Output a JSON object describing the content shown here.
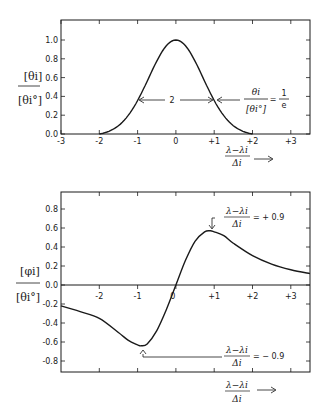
{
  "chart_data": [
    {
      "id": "top",
      "type": "line",
      "title": "",
      "ylabel": "[θi] / [θi°]",
      "xlabel": "(λ−λi)/Δi →",
      "xlim": [
        -3,
        3.5
      ],
      "ylim": [
        0,
        1.2
      ],
      "xticks": [
        "-3",
        "-2",
        "-1",
        "0",
        "+1",
        "+2",
        "+3"
      ],
      "yticks": [
        "0.0",
        "0.2",
        "0.4",
        "0.6",
        "0.8",
        "1.0"
      ],
      "series": [
        {
          "name": "theta_i normalized (Gaussian)",
          "x": [
            -2.0,
            -1.75,
            -1.5,
            -1.25,
            -1.0,
            -0.75,
            -0.5,
            -0.25,
            0.0,
            0.25,
            0.5,
            0.75,
            1.0,
            1.25,
            1.5,
            1.75,
            2.0
          ],
          "y": [
            0.0,
            0.05,
            0.11,
            0.22,
            0.37,
            0.57,
            0.78,
            0.94,
            1.0,
            0.94,
            0.78,
            0.57,
            0.37,
            0.22,
            0.11,
            0.05,
            0.0
          ]
        }
      ],
      "annotations": [
        {
          "text": "2",
          "note": "full width at 1/e between x=-1 and x=+1"
        },
        {
          "text": "θi / [θi°] = 1/e"
        }
      ]
    },
    {
      "id": "bottom",
      "type": "line",
      "title": "",
      "ylabel": "[φi] / [θi°]",
      "xlabel": "(λ−λi)/Δi →",
      "xlim": [
        -3,
        3.5
      ],
      "ylim": [
        -0.9,
        1.0
      ],
      "xticks": [
        "-2",
        "-1",
        "0",
        "+1",
        "+2",
        "+3"
      ],
      "yticks": [
        "0.8",
        "0.6",
        "0.4",
        "0.2",
        "0.0",
        "-0.2",
        "-0.4",
        "-0.6",
        "-0.8"
      ],
      "series": [
        {
          "name": "phi_i normalized (dispersion)",
          "x": [
            -3.0,
            -2.5,
            -2.0,
            -1.5,
            -1.25,
            -1.0,
            -0.9,
            -0.75,
            -0.5,
            -0.25,
            0.0,
            0.25,
            0.5,
            0.75,
            0.9,
            1.0,
            1.25,
            1.5,
            2.0,
            2.5,
            3.0,
            3.5
          ],
          "y": [
            -0.22,
            -0.28,
            -0.35,
            -0.5,
            -0.58,
            -0.63,
            -0.64,
            -0.62,
            -0.48,
            -0.26,
            0.0,
            0.26,
            0.46,
            0.56,
            0.57,
            0.56,
            0.52,
            0.44,
            0.31,
            0.22,
            0.16,
            0.12
          ]
        }
      ],
      "annotations": [
        {
          "text": "(λ−λi)/Δi = +0.9",
          "at": "maximum"
        },
        {
          "text": "(λ−λi)/Δi = −0.9",
          "at": "minimum"
        }
      ]
    }
  ],
  "labels": {
    "top": {
      "ylabel_num": "[θi]",
      "ylabel_den": "[θi°]",
      "width_label": "2",
      "eq_num": "θi",
      "eq_den": "[θi°]",
      "eq_rhs_num": "1",
      "eq_rhs_den": "e",
      "eq_sign": "=",
      "x_num": "λ−λi",
      "x_den": "Δi",
      "x_arrow": "⟶"
    },
    "bottom": {
      "ylabel_num": "[φi]",
      "ylabel_den": "[θi°]",
      "max_num": "λ−λi",
      "max_den": "Δi",
      "max_rhs": "= + 0.9",
      "min_num": "λ−λi",
      "min_den": "Δi",
      "min_rhs": "= − 0.9",
      "x_num": "λ−λi",
      "x_den": "Δi",
      "x_arrow": "⟶"
    }
  }
}
